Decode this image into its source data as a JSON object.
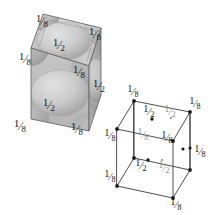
{
  "figure": {
    "label_eighth": "1/8",
    "label_half": "1/2",
    "fraction_eighth": {
      "numerator": "1",
      "denominator": "8"
    },
    "fraction_half": {
      "numerator": "1",
      "denominator": "2"
    },
    "colors": {
      "background": "#ffffff",
      "ink": "#111111",
      "faint_ink": "#8d8d8d",
      "edge_line": "#5a5a5a",
      "wire_line": "#3a3a3a",
      "cube_top_face": "#cfcfcf",
      "cube_front_face": "#bdbdbd",
      "cube_right_face": "#a7a7a7",
      "sphere_light": "#d9d9d9",
      "sphere_mid": "#c2c2c2",
      "sphere_dark": "#9f9f9f"
    }
  },
  "solid_cube": {
    "name": "shaded-unit-cell",
    "corner_labels": [
      {
        "id": "top-back-left",
        "text": "1/8",
        "x": 42,
        "y": 21
      },
      {
        "id": "top-right",
        "text": "1/8",
        "x": 95,
        "y": 34
      },
      {
        "id": "top-left",
        "text": "1/8",
        "x": 25,
        "y": 59
      },
      {
        "id": "top-front-center",
        "text": "1/8",
        "x": 79,
        "y": 72
      },
      {
        "id": "bottom-left",
        "text": "1/8",
        "x": 20,
        "y": 126
      },
      {
        "id": "bottom-front",
        "text": "1/8",
        "x": 77,
        "y": 129
      }
    ],
    "face_labels": [
      {
        "id": "top-face",
        "text": "1/2",
        "x": 59,
        "y": 45
      },
      {
        "id": "front-face",
        "text": "1/2",
        "x": 49,
        "y": 105
      },
      {
        "id": "right-face",
        "text": "1/2",
        "x": 99,
        "y": 86
      }
    ]
  },
  "wire_cube": {
    "name": "wireframe-unit-cell",
    "corner_labels": [
      {
        "id": "wire-top-back-left",
        "text": "1/8",
        "x": 133,
        "y": 92,
        "style": "ink"
      },
      {
        "id": "wire-top-back-right",
        "text": "1/8",
        "x": 195,
        "y": 104,
        "style": "ink"
      },
      {
        "id": "wire-top-front-left",
        "text": "1/8",
        "x": 110,
        "y": 136,
        "style": "ink"
      },
      {
        "id": "wire-top-front-right",
        "text": "1/8",
        "x": 167,
        "y": 138,
        "style": "ink"
      },
      {
        "id": "wire-top-mid-left",
        "text": "1/8",
        "x": 143,
        "y": 135,
        "style": "faint"
      },
      {
        "id": "wire-bottom-right",
        "text": "1/8",
        "x": 196,
        "y": 152,
        "style": "ink"
      },
      {
        "id": "wire-bottom-left",
        "text": "1/8",
        "x": 110,
        "y": 177,
        "style": "ink"
      },
      {
        "id": "wire-bottom-front",
        "text": "1/8",
        "x": 176,
        "y": 192,
        "style": "ink"
      }
    ],
    "face_labels": [
      {
        "id": "wire-top-face-left",
        "text": "1/2",
        "x": 149,
        "y": 112,
        "style": "ink"
      },
      {
        "id": "wire-top-face-right",
        "text": "1/2",
        "x": 169,
        "y": 112,
        "style": "faint"
      },
      {
        "id": "wire-front-face-left",
        "text": "1/2",
        "x": 141,
        "y": 166,
        "style": "ink"
      },
      {
        "id": "wire-front-face-right",
        "text": "1/2",
        "x": 163,
        "y": 168,
        "style": "faint"
      }
    ],
    "dots": [
      {
        "id": "dot-top-face-left",
        "x": 152,
        "y": 119
      },
      {
        "id": "dot-top-face-right",
        "x": 172,
        "y": 118
      },
      {
        "id": "dot-front-face-left",
        "x": 148,
        "y": 160
      },
      {
        "id": "dot-front-face-right",
        "x": 163,
        "y": 160
      },
      {
        "id": "dot-right-face",
        "x": 183,
        "y": 149
      },
      {
        "id": "dot-right-edge",
        "x": 190,
        "y": 148
      }
    ]
  }
}
